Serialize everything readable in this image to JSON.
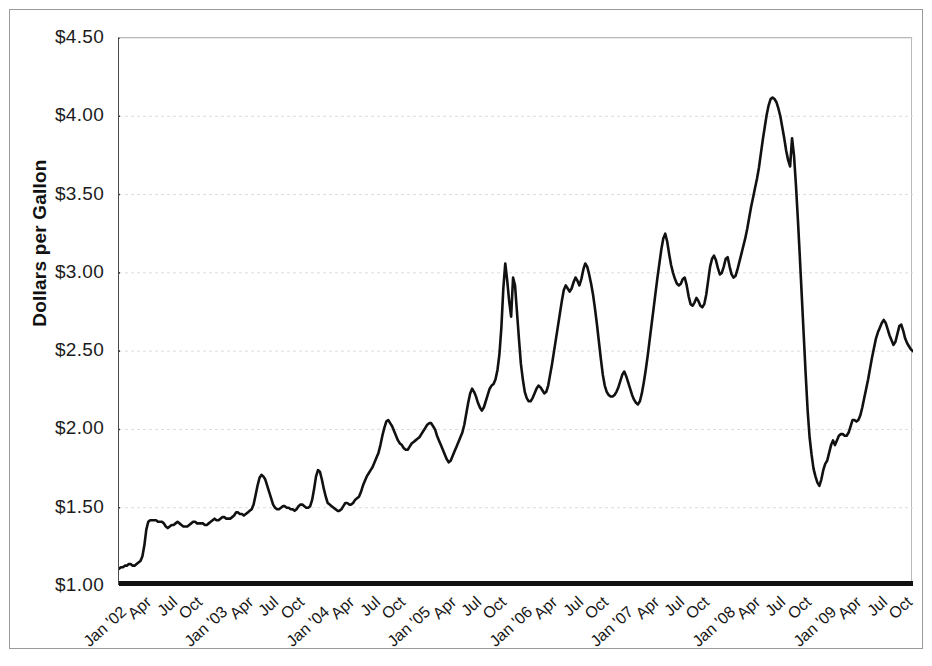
{
  "chart_data": {
    "type": "line",
    "title": "",
    "subtitle": "",
    "xlabel": "",
    "ylabel": "Dollars per Gallon",
    "ylim": [
      1.0,
      4.5
    ],
    "ytick_labels": [
      "$4.50",
      "$4.00",
      "$3.50",
      "$3.00",
      "$2.50",
      "$2.00",
      "$1.50",
      "$1.00"
    ],
    "ytick_values": [
      4.5,
      4.0,
      3.5,
      3.0,
      2.5,
      2.0,
      1.5,
      1.0
    ],
    "grid": "horizontal",
    "legend": "none",
    "line_color": "#111111",
    "xtick_labels": [
      "Jan '02",
      "Apr",
      "Jul",
      "Oct",
      "Jan '03",
      "Apr",
      "Jul",
      "Oct",
      "Jan '04",
      "Apr",
      "Jul",
      "Oct",
      "Jan '05",
      "Apr",
      "Jul",
      "Oct",
      "Jan '06",
      "Apr",
      "Jul",
      "Oct",
      "Jan '07",
      "Apr",
      "Jul",
      "Oct",
      "Jan '08",
      "Apr",
      "Jul",
      "Oct",
      "Jan '09",
      "Apr",
      "Jul",
      "Oct"
    ],
    "x_start": "Jan '02",
    "x_end": "Dec '09",
    "x_interval": "weekly",
    "series": [
      {
        "name": "Retail gasoline price",
        "values": [
          1.11,
          1.12,
          1.12,
          1.13,
          1.13,
          1.14,
          1.14,
          1.13,
          1.13,
          1.14,
          1.15,
          1.16,
          1.19,
          1.26,
          1.36,
          1.41,
          1.42,
          1.42,
          1.42,
          1.42,
          1.41,
          1.41,
          1.41,
          1.4,
          1.38,
          1.37,
          1.38,
          1.39,
          1.39,
          1.4,
          1.41,
          1.4,
          1.39,
          1.38,
          1.38,
          1.38,
          1.39,
          1.4,
          1.41,
          1.41,
          1.4,
          1.4,
          1.4,
          1.4,
          1.39,
          1.39,
          1.4,
          1.41,
          1.42,
          1.43,
          1.42,
          1.42,
          1.43,
          1.44,
          1.44,
          1.43,
          1.43,
          1.43,
          1.44,
          1.45,
          1.47,
          1.47,
          1.46,
          1.46,
          1.45,
          1.46,
          1.47,
          1.48,
          1.49,
          1.52,
          1.58,
          1.64,
          1.69,
          1.71,
          1.7,
          1.68,
          1.64,
          1.6,
          1.56,
          1.52,
          1.5,
          1.49,
          1.49,
          1.5,
          1.51,
          1.51,
          1.5,
          1.5,
          1.49,
          1.49,
          1.48,
          1.49,
          1.51,
          1.52,
          1.52,
          1.51,
          1.5,
          1.5,
          1.51,
          1.55,
          1.62,
          1.7,
          1.74,
          1.73,
          1.68,
          1.62,
          1.57,
          1.53,
          1.52,
          1.51,
          1.5,
          1.49,
          1.48,
          1.48,
          1.49,
          1.51,
          1.53,
          1.53,
          1.52,
          1.52,
          1.53,
          1.55,
          1.56,
          1.57,
          1.6,
          1.64,
          1.67,
          1.7,
          1.72,
          1.74,
          1.76,
          1.79,
          1.82,
          1.85,
          1.9,
          1.96,
          2.01,
          2.05,
          2.06,
          2.04,
          2.02,
          1.99,
          1.96,
          1.93,
          1.91,
          1.9,
          1.88,
          1.87,
          1.87,
          1.89,
          1.91,
          1.92,
          1.93,
          1.94,
          1.95,
          1.97,
          1.99,
          2.01,
          2.03,
          2.04,
          2.04,
          2.02,
          2.0,
          1.96,
          1.93,
          1.9,
          1.87,
          1.84,
          1.81,
          1.79,
          1.8,
          1.83,
          1.86,
          1.89,
          1.92,
          1.95,
          1.98,
          2.03,
          2.1,
          2.17,
          2.23,
          2.26,
          2.24,
          2.21,
          2.17,
          2.14,
          2.12,
          2.14,
          2.18,
          2.22,
          2.26,
          2.28,
          2.29,
          2.32,
          2.38,
          2.48,
          2.65,
          2.9,
          3.06,
          2.95,
          2.82,
          2.72,
          2.97,
          2.92,
          2.75,
          2.58,
          2.42,
          2.32,
          2.24,
          2.2,
          2.18,
          2.18,
          2.2,
          2.23,
          2.26,
          2.28,
          2.27,
          2.25,
          2.23,
          2.24,
          2.28,
          2.35,
          2.42,
          2.5,
          2.58,
          2.66,
          2.74,
          2.82,
          2.89,
          2.92,
          2.9,
          2.88,
          2.9,
          2.94,
          2.97,
          2.95,
          2.92,
          2.96,
          3.02,
          3.06,
          3.04,
          2.99,
          2.93,
          2.86,
          2.77,
          2.67,
          2.56,
          2.45,
          2.35,
          2.28,
          2.24,
          2.22,
          2.21,
          2.21,
          2.22,
          2.24,
          2.27,
          2.31,
          2.35,
          2.37,
          2.34,
          2.3,
          2.26,
          2.22,
          2.19,
          2.17,
          2.16,
          2.18,
          2.23,
          2.3,
          2.38,
          2.47,
          2.57,
          2.67,
          2.77,
          2.87,
          2.97,
          3.06,
          3.15,
          3.22,
          3.25,
          3.2,
          3.12,
          3.05,
          3.0,
          2.96,
          2.93,
          2.92,
          2.93,
          2.96,
          2.97,
          2.92,
          2.85,
          2.8,
          2.79,
          2.81,
          2.84,
          2.82,
          2.79,
          2.78,
          2.8,
          2.86,
          2.95,
          3.04,
          3.09,
          3.11,
          3.08,
          3.03,
          2.99,
          3.0,
          3.04,
          3.09,
          3.1,
          3.04,
          2.99,
          2.97,
          2.98,
          3.02,
          3.07,
          3.12,
          3.17,
          3.22,
          3.28,
          3.35,
          3.42,
          3.48,
          3.54,
          3.6,
          3.67,
          3.76,
          3.85,
          3.93,
          4.01,
          4.07,
          4.11,
          4.12,
          4.11,
          4.09,
          4.05,
          4.0,
          3.93,
          3.86,
          3.78,
          3.72,
          3.68,
          3.86,
          3.75,
          3.56,
          3.34,
          3.1,
          2.85,
          2.6,
          2.35,
          2.12,
          1.95,
          1.84,
          1.75,
          1.7,
          1.66,
          1.64,
          1.68,
          1.74,
          1.78,
          1.8,
          1.85,
          1.9,
          1.93,
          1.9,
          1.93,
          1.96,
          1.97,
          1.97,
          1.96,
          1.96,
          1.98,
          2.02,
          2.06,
          2.06,
          2.05,
          2.06,
          2.09,
          2.14,
          2.2,
          2.26,
          2.32,
          2.39,
          2.46,
          2.52,
          2.58,
          2.62,
          2.65,
          2.68,
          2.7,
          2.68,
          2.64,
          2.6,
          2.57,
          2.54,
          2.56,
          2.61,
          2.66,
          2.67,
          2.63,
          2.58,
          2.55,
          2.53,
          2.51,
          2.5
        ]
      }
    ],
    "notable_points": [
      {
        "label": "start",
        "x": "Jan '02",
        "y": 1.11
      },
      {
        "label": "peak",
        "x": "Jul '08",
        "y": 4.12
      },
      {
        "label": "trough after peak",
        "x": "Dec '08",
        "y": 1.64
      },
      {
        "label": "end",
        "x": "Dec '09",
        "y": 2.5
      }
    ]
  }
}
